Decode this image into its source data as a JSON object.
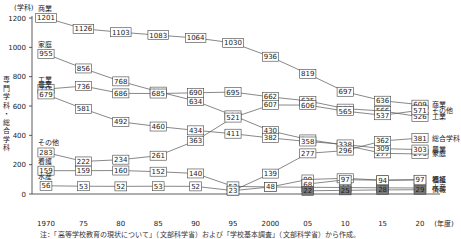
{
  "chart_data": {
    "type": "line",
    "title": "",
    "ylabel": "専門学科・総合学科",
    "yunit": "(学科)",
    "xunit": "(年度)",
    "ylim": [
      0,
      1200
    ],
    "yticks": [
      0,
      200,
      400,
      600,
      800,
      1000,
      1200
    ],
    "x": [
      1970,
      1975,
      1980,
      1985,
      1990,
      1995,
      2000,
      2005,
      2010,
      2015,
      2020
    ],
    "xtick_labels": [
      "1970",
      "75",
      "80",
      "85",
      "90",
      "95",
      "2000",
      "05",
      "10",
      "15",
      "20"
    ],
    "series": [
      {
        "name": "商業",
        "values": [
          1201,
          1126,
          1103,
          1083,
          1064,
          1030,
          936,
          819,
          697,
          636,
          609
        ]
      },
      {
        "name": "家庭",
        "values": [
          955,
          856,
          768,
          698,
          634,
          536,
          430,
          372,
          332,
          277,
          273
        ]
      },
      {
        "name": "工業",
        "values": [
          715,
          736,
          686,
          685,
          690,
          695,
          662,
          635,
          582,
          566,
          526
        ]
      },
      {
        "name": "農業",
        "values": [
          679,
          581,
          492,
          460,
          434,
          411,
          382,
          358,
          338,
          309,
          303
        ]
      },
      {
        "name": "その他",
        "values": [
          283,
          222,
          234,
          261,
          363,
          521,
          607,
          606,
          565,
          537,
          571
        ]
      },
      {
        "name": "総合学科",
        "values": [
          null,
          null,
          null,
          null,
          null,
          23,
          139,
          277,
          296,
          362,
          381
        ]
      },
      {
        "name": "看護",
        "values": [
          159,
          159,
          160,
          152,
          140,
          52,
          48,
          99,
          107,
          94,
          97
        ]
      },
      {
        "name": "水産",
        "values": [
          56,
          53,
          52,
          53,
          52,
          23,
          48,
          46,
          44,
          42,
          41
        ]
      },
      {
        "name": "福祉",
        "values": [
          null,
          null,
          null,
          null,
          null,
          null,
          null,
          68,
          97,
          94,
          97
        ]
      },
      {
        "name": "情報",
        "values": [
          null,
          null,
          null,
          null,
          null,
          null,
          null,
          22,
          25,
          28,
          29
        ]
      }
    ],
    "annotations": [
      "総合学科",
      "福祉",
      "情報"
    ]
  },
  "note": "注：「高等学校教育の現状について」（文部科学省）および「学校基本調査」（文部科学省）から作成。"
}
